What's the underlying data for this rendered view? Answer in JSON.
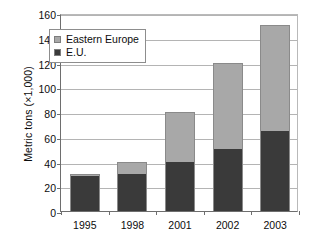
{
  "chart_data": {
    "type": "bar",
    "stacked": true,
    "title": "",
    "xlabel": "",
    "ylabel": "Metric tons (×1,000)",
    "categories": [
      "1995",
      "1998",
      "2001",
      "2002",
      "2003"
    ],
    "series": [
      {
        "name": "E.U.",
        "values": [
          28,
          30,
          40,
          50,
          65
        ],
        "color": "#3a3a3a"
      },
      {
        "name": "Eastern Europe",
        "values": [
          2,
          10,
          40,
          70,
          85
        ],
        "color": "#a8a8a8"
      }
    ],
    "totals": [
      30,
      40,
      80,
      120,
      150
    ],
    "ylim": [
      0,
      160
    ],
    "ytick_step": 20,
    "yticks": [
      "160",
      "140",
      "120",
      "100",
      "80",
      "60",
      "40",
      "20",
      "0"
    ],
    "ytick_values": [
      160,
      140,
      120,
      100,
      80,
      60,
      40,
      20,
      0
    ],
    "grid": true,
    "legend_position": "upper-center-left",
    "legend_entries": [
      {
        "label": "Eastern Europe",
        "color": "#a8a8a8"
      },
      {
        "label": "E.U.",
        "color": "#3a3a3a"
      }
    ]
  }
}
